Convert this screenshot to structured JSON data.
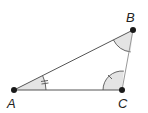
{
  "diagram": {
    "type": "triangle",
    "vertices": [
      {
        "id": "A",
        "label": "A",
        "x": 14,
        "y": 90,
        "lx": 7,
        "ly": 108
      },
      {
        "id": "B",
        "label": "B",
        "x": 133,
        "y": 30,
        "lx": 126,
        "ly": 22
      },
      {
        "id": "C",
        "label": "C",
        "x": 122,
        "y": 90,
        "lx": 118,
        "ly": 108
      }
    ],
    "angles": [
      {
        "vertex": "A",
        "marker": "double-tick"
      },
      {
        "vertex": "B",
        "marker": "arc"
      },
      {
        "vertex": "C",
        "marker": "single-tick"
      }
    ],
    "colors": {
      "line": "#555555",
      "point": "#1a1a1a",
      "fill": "#e4e4e4"
    }
  }
}
